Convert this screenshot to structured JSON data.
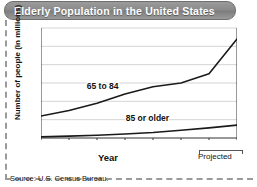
{
  "figure": {
    "title": "Elderly Population in the United States",
    "source": "Source: U.S. Census Bureau.",
    "projected_note": "Projected",
    "banner_color": "#8a8a8a",
    "line_color": "#1a1a1a"
  },
  "chart_data": {
    "type": "line",
    "title": "Elderly Population in the United States",
    "xlabel": "Year",
    "ylabel": "Number of people (in millions)",
    "x": [
      1950,
      1960,
      1970,
      1980,
      1990,
      2000,
      2010,
      2020
    ],
    "xticklabels": [
      "1950",
      "1960",
      "1970",
      "1980",
      "1990",
      "2000",
      "2010",
      "2020"
    ],
    "yticks": [
      0,
      10,
      20,
      30,
      40,
      50,
      60
    ],
    "yticklabels": [
      "0",
      "10",
      "20",
      "30",
      "40",
      "50",
      "60"
    ],
    "xlim": [
      1950,
      2020
    ],
    "ylim": [
      0,
      60
    ],
    "grid": "horizontal",
    "legend": "inline-labels",
    "annotations": [
      "Projected"
    ],
    "series": [
      {
        "name": "65 to 84",
        "label": "65 to 84",
        "values": [
          12,
          15,
          19,
          24,
          28,
          30,
          35,
          54
        ]
      },
      {
        "name": "85 or older",
        "label": "85 or older",
        "values": [
          0.6,
          1.0,
          1.5,
          2.2,
          3.0,
          4.2,
          5.5,
          7.0
        ]
      }
    ]
  }
}
